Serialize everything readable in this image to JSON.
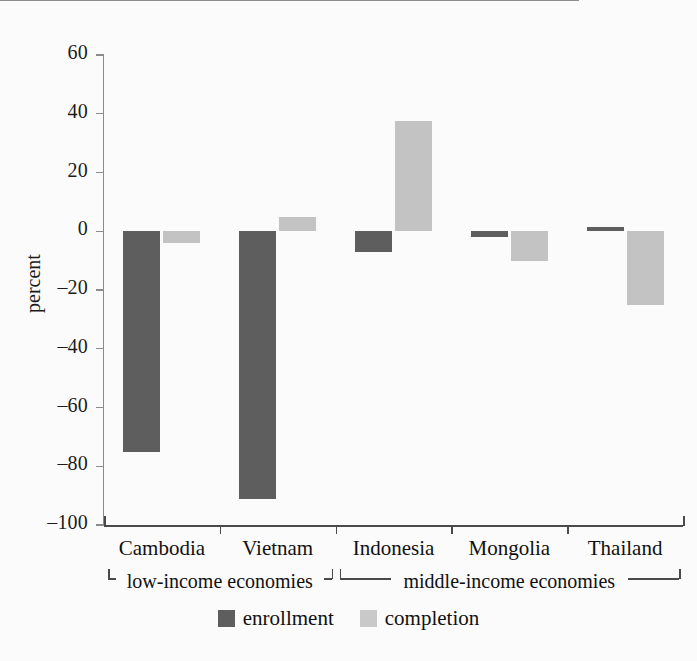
{
  "chart_data": {
    "type": "bar",
    "title": "",
    "subtitle": "",
    "xlabel": "",
    "ylabel": "percent",
    "ylim": [
      -100,
      60
    ],
    "yticks": [
      60,
      40,
      20,
      0,
      -20,
      -40,
      -60,
      -80,
      -100
    ],
    "ytick_labels": [
      "60",
      "40",
      "20",
      "0",
      "–20",
      "–40",
      "–60",
      "–80",
      "–100"
    ],
    "grid": false,
    "legend_position": "bottom",
    "categories": [
      "Cambodia",
      "Vietnam",
      "Indonesia",
      "Mongolia",
      "Thailand"
    ],
    "series": [
      {
        "name": "enrollment",
        "color": "#5e5e5e",
        "values": [
          -75,
          -91,
          -7,
          -2,
          1.5
        ]
      },
      {
        "name": "completion",
        "color": "#c3c3c3",
        "values": [
          -4,
          5,
          37.5,
          -10,
          -25
        ]
      }
    ],
    "groups": [
      {
        "label": "low-income economies",
        "categories": [
          "Cambodia",
          "Vietnam"
        ]
      },
      {
        "label": "middle-income economies",
        "categories": [
          "Indonesia",
          "Mongolia",
          "Thailand"
        ]
      }
    ]
  },
  "axis": {
    "y_title": "percent",
    "ticks": [
      {
        "value": 60,
        "label": "60"
      },
      {
        "value": 40,
        "label": "40"
      },
      {
        "value": 20,
        "label": "20"
      },
      {
        "value": 0,
        "label": "0"
      },
      {
        "value": -20,
        "label": "–20"
      },
      {
        "value": -40,
        "label": "–40"
      },
      {
        "value": -60,
        "label": "–60"
      },
      {
        "value": -80,
        "label": "–80"
      },
      {
        "value": -100,
        "label": "–100"
      }
    ]
  },
  "categories": [
    {
      "label": "Cambodia"
    },
    {
      "label": "Vietnam"
    },
    {
      "label": "Indonesia"
    },
    {
      "label": "Mongolia"
    },
    {
      "label": "Thailand"
    }
  ],
  "groups": [
    {
      "label": "low-income economies"
    },
    {
      "label": "middle-income economies"
    }
  ],
  "legend": [
    {
      "label": "enrollment",
      "color": "#5e5e5e"
    },
    {
      "label": "completion",
      "color": "#c9c9c9"
    }
  ]
}
